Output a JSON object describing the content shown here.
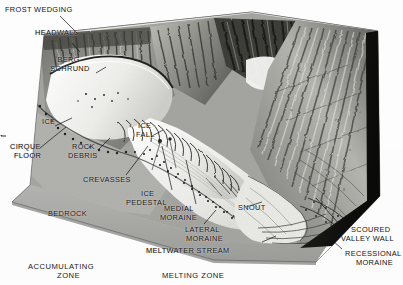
{
  "figure": {
    "kind": "geologic-block-diagram",
    "palette": {
      "paper": "#fdfdfd",
      "ink": "#111111",
      "bedrock_face": "#a9a9a9",
      "bedrock_face_dark": "#8f8f8f",
      "cut_side_dark": "#151515",
      "ice_white": "#f4f4f2",
      "ice_shadow": "#cfcfcc",
      "rock_light": "#c8c8c4",
      "rock_mid": "#9a9a96",
      "rock_dark": "#4a4a48",
      "sky": "#f2f2f0"
    }
  },
  "labels": {
    "frost_wedging": "FROST WEDGING",
    "headwall": "HEADWALL",
    "bergschrund_line1": "BERG-",
    "bergschrund_line2": "SCHRUND",
    "ice": "ICE",
    "cirque_floor_line1": "CIRQUE",
    "cirque_floor_line2": "FLOOR",
    "rock_debris_line1": "ROCK",
    "rock_debris_line2": "DEBRIS",
    "crevasses": "CREVASSES",
    "ice_fall_line1": "ICE",
    "ice_fall_line2": "FALL",
    "ice_pedestal_line1": "ICE",
    "ice_pedestal_line2": "PEDESTAL",
    "bedrock": "BEDROCK",
    "medial_moraine_line1": "MEDIAL",
    "medial_moraine_line2": "MORAINE",
    "lateral_moraine_line1": "LATERAL",
    "lateral_moraine_line2": "MORAINE",
    "meltwater_stream": "MELTWATER STREAM",
    "snout": "SNOUT",
    "scoured_valley_wall_line1": "SCOURED",
    "scoured_valley_wall_line2": "VALLEY WALL",
    "recessional_moraine_line1": "RECESSIONAL",
    "recessional_moraine_line2": "MORAINE",
    "accumulating_zone_line1": "ACCUMULATING",
    "accumulating_zone_line2": "ZONE",
    "melting_zone": "MELTING ZONE",
    "left_edge_tick": "-"
  }
}
